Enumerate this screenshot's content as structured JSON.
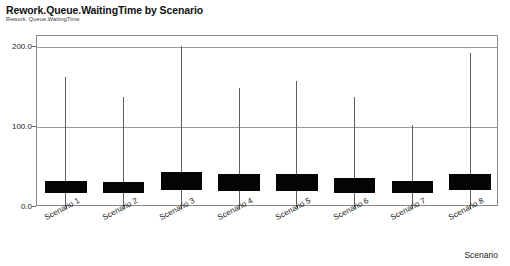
{
  "chart_data": {
    "type": "box",
    "title": "Rework.Queue.WaitingTime by Scenario",
    "subtitle": "Rework. Queue.WaitingTime",
    "xlabel": "Scenario",
    "ylabel": "",
    "ylim": [
      0,
      210
    ],
    "grid": true,
    "legend": "none",
    "yticks": [
      {
        "value": 200,
        "label": "200.0"
      },
      {
        "value": 100,
        "label": "100.0"
      },
      {
        "value": 0,
        "label": "0.0"
      }
    ],
    "categories": [
      "Scenario 1",
      "Scenario 2",
      "Scenario 3",
      "Scenario 4",
      "Scenario 5",
      "Scenario 6",
      "Scenario 7",
      "Scenario 8"
    ],
    "boxes": [
      {
        "category": "Scenario 1",
        "box_low": 18,
        "box_high": 33,
        "whisker_low": 0,
        "whisker_high": 162
      },
      {
        "category": "Scenario 2",
        "box_low": 17,
        "box_high": 31,
        "whisker_low": 0,
        "whisker_high": 137
      },
      {
        "category": "Scenario 3",
        "box_low": 21,
        "box_high": 44,
        "whisker_low": 0,
        "whisker_high": 201
      },
      {
        "category": "Scenario 4",
        "box_low": 20,
        "box_high": 41,
        "whisker_low": 0,
        "whisker_high": 149
      },
      {
        "category": "Scenario 5",
        "box_low": 20,
        "box_high": 41,
        "whisker_low": 0,
        "whisker_high": 158
      },
      {
        "category": "Scenario 6",
        "box_low": 18,
        "box_high": 36,
        "whisker_low": 0,
        "whisker_high": 137
      },
      {
        "category": "Scenario 7",
        "box_low": 17,
        "box_high": 32,
        "whisker_low": 0,
        "whisker_high": 102
      },
      {
        "category": "Scenario 8",
        "box_low": 21,
        "box_high": 41,
        "whisker_low": 0,
        "whisker_high": 193
      }
    ],
    "colors": {
      "box_fill": "#050505",
      "whisker": "#5f5f5f",
      "grid": "#9a9a9a",
      "frame": "#8a8a8a",
      "text": "#1a1a1a",
      "background": "#ffffff"
    }
  }
}
